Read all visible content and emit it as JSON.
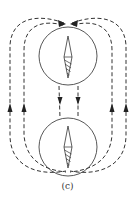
{
  "figure": {
    "caption": "(c)",
    "colors": {
      "line": "#333333",
      "background": "#ffffff"
    },
    "compasses": [
      {
        "name": "top-compass",
        "center": [
          68,
          56
        ],
        "radius": 29,
        "needle_north": "up"
      },
      {
        "name": "bottom-compass",
        "center": [
          68,
          147
        ],
        "radius": 29,
        "needle_north": "up"
      }
    ],
    "field_lines": {
      "left_loops": 2,
      "right_loops": 2,
      "inner_connectors": 2,
      "arrow_directions": {
        "top_junction": "inward",
        "between_compasses": "down",
        "outer_sides": "up"
      }
    }
  }
}
